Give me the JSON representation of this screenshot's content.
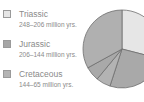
{
  "chart_data": {
    "type": "pie",
    "title": "",
    "legend_position": "left",
    "categories": [
      "Triassic",
      "Jurassic",
      "Cretaceous"
    ],
    "legend": [
      {
        "label": "Triassic",
        "sublabel": "248–206 million yrs.",
        "color": "#e6e6e6"
      },
      {
        "label": "Jurassic",
        "sublabel": "206–144 million yrs.",
        "color": "#a6a6a6"
      },
      {
        "label": "Cretaceous",
        "sublabel": "144–65 million yrs.",
        "color": "#b4b4b4"
      }
    ],
    "slices": [
      {
        "label": "Triassic",
        "value": 29,
        "color": "#e6e6e6"
      },
      {
        "label": "Jurassic",
        "value": 26,
        "color": "#a9a9a9"
      },
      {
        "label": "slice-3",
        "value": 6,
        "color": "#b3b3b3"
      },
      {
        "label": "slice-4",
        "value": 6,
        "color": "#a9a9a9"
      },
      {
        "label": "Cretaceous",
        "value": 33,
        "color": "#b0b0b0"
      }
    ]
  }
}
